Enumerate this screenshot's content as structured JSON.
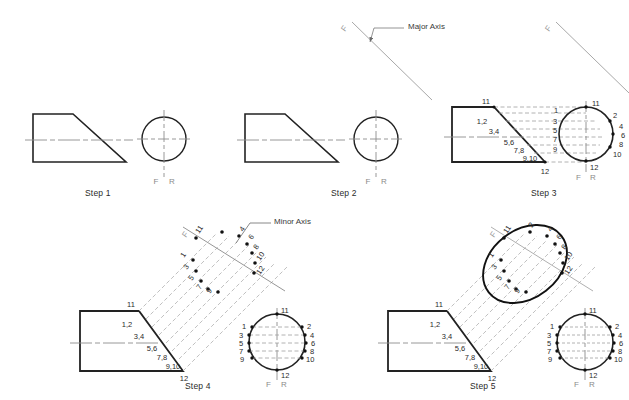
{
  "page": {
    "background_color": "#ffffff",
    "ink_color": "#1a1a1a",
    "construction_color": "#9a9a9a",
    "axis_color": "#8c8c8c"
  },
  "annotations": {
    "major_axis_label": "Major Axis",
    "minor_axis_label": "Minor Axis",
    "front_marker": "F",
    "rear_marker": "R",
    "fold_marker": "F"
  },
  "steps": [
    {
      "id": "step1",
      "caption": "Step 1",
      "front_view": "trapezoidal wedge outline",
      "right_view": "circle with centerlines",
      "view_labels": {
        "front": "F",
        "rear": "R"
      },
      "point_labels": []
    },
    {
      "id": "step2",
      "caption": "Step 2",
      "front_view": "trapezoidal wedge outline",
      "right_view": "circle with centerlines",
      "view_labels": {
        "front": "F",
        "rear": "R"
      },
      "point_labels": []
    },
    {
      "id": "step3",
      "caption": "Step 3",
      "view_labels": {
        "front": "F",
        "rear": "R"
      },
      "incline_labels": [
        "11",
        "1,2",
        "3,4",
        "5,6",
        "7,8",
        "9,10",
        "12"
      ],
      "circle_left_labels": [
        "1",
        "3",
        "5",
        "7",
        "9"
      ],
      "circle_right_labels": [
        "2",
        "4",
        "6",
        "8",
        "10"
      ],
      "circle_top_label": "11",
      "circle_bottom_label": "12"
    },
    {
      "id": "step4",
      "caption": "Step 4",
      "view_labels": {
        "front": "F",
        "rear": "R"
      },
      "incline_labels": [
        "11",
        "1,2",
        "3,4",
        "5,6",
        "7,8",
        "9,10",
        "12"
      ],
      "circle_left_labels": [
        "1",
        "3",
        "5",
        "7",
        "9"
      ],
      "circle_right_labels": [
        "2",
        "4",
        "6",
        "8",
        "10"
      ],
      "circle_top_label": "11",
      "circle_bottom_label": "12",
      "plotted_point_labels": [
        "11",
        "1",
        "3",
        "5",
        "7",
        "9",
        "2",
        "4",
        "6",
        "8",
        "10",
        "12"
      ],
      "fold_label": "F"
    },
    {
      "id": "step5",
      "caption": "Step 5",
      "view_labels": {
        "front": "F",
        "rear": "R"
      },
      "incline_labels": [
        "11",
        "1,2",
        "3,4",
        "5,6",
        "7,8",
        "9,10",
        "12"
      ],
      "circle_left_labels": [
        "1",
        "3",
        "5",
        "7",
        "9"
      ],
      "circle_right_labels": [
        "2",
        "4",
        "6",
        "8",
        "10"
      ],
      "circle_top_label": "11",
      "circle_bottom_label": "12",
      "ellipse_point_labels": [
        "11",
        "1",
        "3",
        "5",
        "7",
        "9",
        "2",
        "4",
        "6",
        "8",
        "10",
        "12"
      ],
      "fold_label": "F"
    }
  ],
  "captions": {
    "step1": "Step 1",
    "step2": "Step 2",
    "step3": "Step 3",
    "step4": "Step 4",
    "step5": "Step 5"
  },
  "labels": {
    "major_axis": "Major Axis",
    "minor_axis": "Minor Axis",
    "F": "F",
    "R": "R",
    "n1": "1",
    "n2": "2",
    "n3": "3",
    "n4": "4",
    "n5": "5",
    "n6": "6",
    "n7": "7",
    "n8": "8",
    "n9": "9",
    "n10": "10",
    "n11": "11",
    "n12": "12",
    "p12": "1,2",
    "p34": "3,4",
    "p56": "5,6",
    "p78": "7,8",
    "p910": "9,10"
  }
}
